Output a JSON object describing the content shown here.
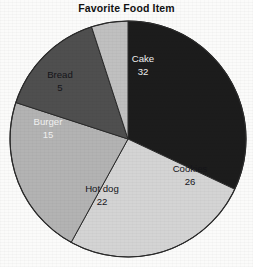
{
  "chart_data": {
    "type": "pie",
    "title": "Favorite Food Item",
    "xlabel": "",
    "ylabel": "",
    "total": 100,
    "grid": false,
    "legend": "none",
    "label_placement": "inside-slice",
    "start_angle_deg": 0,
    "direction": "clockwise",
    "categories": [
      "Cake",
      "Cookies",
      "Hot dog",
      "Burger",
      "Bread"
    ],
    "values": [
      32,
      26,
      22,
      15,
      5
    ],
    "slices": [
      {
        "name": "Cake",
        "value": 32,
        "color": "#1c1c1c",
        "label_color": "light",
        "label_x": 143,
        "label_y": 62
      },
      {
        "name": "Cookies",
        "value": 26,
        "color": "#d4d4d4",
        "label_color": "dark",
        "label_y": 172,
        "label_x": 190
      },
      {
        "name": "Hot dog",
        "value": 22,
        "color": "#b3b3b3",
        "label_color": "dark",
        "label_x": 102,
        "label_y": 192
      },
      {
        "name": "Burger",
        "value": 15,
        "color": "#4f4f4f",
        "label_color": "light",
        "label_x": 48,
        "label_y": 125
      },
      {
        "name": "Bread",
        "value": 5,
        "color": "#c0c0c0",
        "label_color": "dark",
        "label_x": 60,
        "label_y": 78
      }
    ],
    "geometry": {
      "center_x": 128,
      "center_y": 139,
      "radius": 118,
      "outline_color": "#2a2a2a"
    }
  }
}
